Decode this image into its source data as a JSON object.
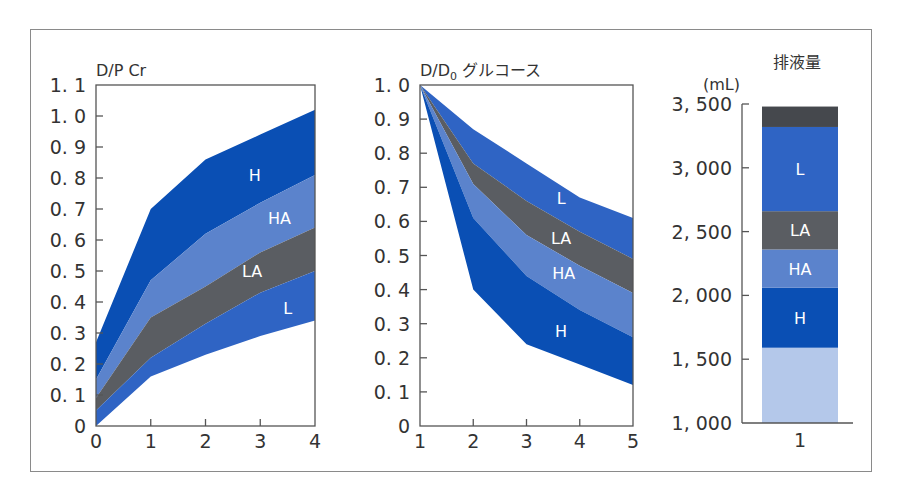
{
  "chart_data": [
    {
      "type": "area",
      "title": "D/P Cr",
      "xlabel": "",
      "ylabel": "D/P Cr",
      "x": [
        0,
        1,
        2,
        3,
        4
      ],
      "xticks": [
        "0",
        "1",
        "2",
        "3",
        "4"
      ],
      "yticks": [
        "0",
        "0.1",
        "0.2",
        "0.3",
        "0.4",
        "0.5",
        "0.6",
        "0.7",
        "0.8",
        "0.9",
        "1.0",
        "1.1"
      ],
      "ylim": [
        0,
        1.1
      ],
      "xlim": [
        0,
        4
      ],
      "grid": false,
      "series": [
        {
          "name": "H",
          "lower": [
            0.15,
            0.47,
            0.62,
            0.72,
            0.81
          ],
          "upper": [
            0.27,
            0.7,
            0.86,
            0.94,
            1.02
          ],
          "color": "#0a4fb4",
          "label_pos": [
            2.9,
            0.81
          ]
        },
        {
          "name": "HA",
          "lower": [
            0.09,
            0.35,
            0.45,
            0.56,
            0.64
          ],
          "upper": [
            0.15,
            0.47,
            0.62,
            0.72,
            0.81
          ],
          "color": "#5b83cc",
          "label_pos": [
            3.35,
            0.67
          ]
        },
        {
          "name": "LA",
          "lower": [
            0.05,
            0.22,
            0.33,
            0.43,
            0.5
          ],
          "upper": [
            0.09,
            0.35,
            0.45,
            0.56,
            0.64
          ],
          "color": "#5a5d62",
          "label_pos": [
            2.85,
            0.5
          ]
        },
        {
          "name": "L",
          "lower": [
            0.0,
            0.16,
            0.23,
            0.29,
            0.34
          ],
          "upper": [
            0.05,
            0.22,
            0.33,
            0.43,
            0.5
          ],
          "color": "#2f64c4",
          "label_pos": [
            3.5,
            0.38
          ]
        }
      ]
    },
    {
      "type": "area",
      "title": "D/D0 グルコース",
      "title_main": "D/D",
      "title_sub": "0",
      "title_suffix": " グルコース",
      "xlabel": "",
      "ylabel": "D/D0 グルコース",
      "x": [
        1,
        2,
        3,
        4,
        5
      ],
      "xticks": [
        "1",
        "2",
        "3",
        "4",
        "5"
      ],
      "yticks": [
        "0",
        "0.1",
        "0.2",
        "0.3",
        "0.4",
        "0.5",
        "0.6",
        "0.7",
        "0.8",
        "0.9",
        "1.0"
      ],
      "ylim": [
        0,
        1.0
      ],
      "xlim": [
        1,
        5
      ],
      "grid": false,
      "series": [
        {
          "name": "L",
          "lower": [
            1.0,
            0.77,
            0.66,
            0.57,
            0.49
          ],
          "upper": [
            1.0,
            0.87,
            0.77,
            0.67,
            0.61
          ],
          "color": "#2f64c4",
          "label_pos": [
            3.65,
            0.67
          ]
        },
        {
          "name": "LA",
          "lower": [
            1.0,
            0.71,
            0.56,
            0.47,
            0.39
          ],
          "upper": [
            1.0,
            0.77,
            0.66,
            0.57,
            0.49
          ],
          "color": "#5a5d62",
          "label_pos": [
            3.65,
            0.55
          ]
        },
        {
          "name": "HA",
          "lower": [
            1.0,
            0.61,
            0.44,
            0.34,
            0.26
          ],
          "upper": [
            1.0,
            0.71,
            0.56,
            0.47,
            0.39
          ],
          "color": "#5b83cc",
          "label_pos": [
            3.7,
            0.45
          ]
        },
        {
          "name": "H",
          "lower": [
            1.0,
            0.4,
            0.24,
            0.18,
            0.12
          ],
          "upper": [
            1.0,
            0.61,
            0.44,
            0.34,
            0.26
          ],
          "color": "#0a4fb4",
          "label_pos": [
            3.65,
            0.28
          ]
        }
      ]
    },
    {
      "type": "bar",
      "title": "排液量",
      "unit": "(mL)",
      "categories": [
        "1"
      ],
      "xticks": [
        "1"
      ],
      "yticks": [
        "1, 000",
        "1, 500",
        "2, 000",
        "2, 500",
        "3, 000",
        "3, 500"
      ],
      "ylim": [
        1000,
        3500
      ],
      "grid": false,
      "stacked": true,
      "segments": [
        {
          "name": "",
          "from": 1000,
          "to": 1590,
          "color": "#b4c8ea"
        },
        {
          "name": "H",
          "from": 1590,
          "to": 2060,
          "color": "#0a4fb4"
        },
        {
          "name": "HA",
          "from": 2060,
          "to": 2360,
          "color": "#5b83cc"
        },
        {
          "name": "LA",
          "from": 2360,
          "to": 2660,
          "color": "#5a5d62"
        },
        {
          "name": "L",
          "from": 2660,
          "to": 3320,
          "color": "#2f64c4"
        },
        {
          "name": "",
          "from": 3320,
          "to": 3480,
          "color": "#45484d"
        }
      ]
    }
  ]
}
